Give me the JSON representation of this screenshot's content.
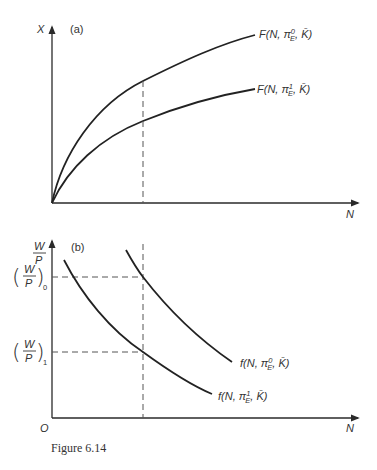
{
  "figure": {
    "caption": "Figure 6.14",
    "stroke_color": "#222222",
    "background": "#ffffff"
  },
  "panel_a": {
    "tag": "(a)",
    "y_axis_label": "X",
    "x_axis_label": "N",
    "curves": [
      {
        "id": "F0",
        "func": "F",
        "args_prefix": "(N, π",
        "sup": "0",
        "sub": "E",
        "args_suffix": ", K̄)",
        "label": "F(N, π⁰E, K̄)"
      },
      {
        "id": "F1",
        "func": "F",
        "args_prefix": "(N, π",
        "sup": "1",
        "sub": "E",
        "args_suffix": ", K̄)",
        "label": "F(N, π¹E, K̄)"
      }
    ]
  },
  "panel_b": {
    "tag": "(b)",
    "y_axis_label_num": "W",
    "y_axis_label_den": "P",
    "origin_label": "O",
    "x_axis_label": "N",
    "wage_levels": [
      {
        "id": "w0",
        "num": "W",
        "den": "P",
        "sub": "0",
        "label": "(W/P)₀"
      },
      {
        "id": "w1",
        "num": "W",
        "den": "P",
        "sub": "1",
        "label": "(W/P)₁"
      }
    ],
    "curves": [
      {
        "id": "f0",
        "func": "f",
        "args_prefix": "(N, π",
        "sup": "0",
        "sub": "E",
        "args_suffix": ", K̄)",
        "label": "f(N, π⁰E, K̄)"
      },
      {
        "id": "f1",
        "func": "f",
        "args_prefix": "(N, π",
        "sup": "1",
        "sub": "E",
        "args_suffix": ", K̄)",
        "label": "f(N, π¹E, K̄)"
      }
    ]
  }
}
